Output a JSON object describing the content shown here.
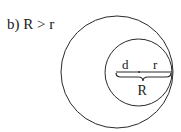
{
  "caption": "b) R > r",
  "labels": {
    "d": "d",
    "r": "r",
    "R": "R"
  },
  "colors": {
    "stroke": "#2a2a2a",
    "text": "#1a1a1a",
    "background": "#ffffff"
  },
  "figure": {
    "outer_circle": {
      "cx": 117,
      "cy": 72,
      "r": 56
    },
    "inner_circle": {
      "cx": 138.5,
      "cy": 72.5,
      "r": 33.5
    },
    "segment": {
      "x1": 116,
      "x2": 172,
      "y": 72,
      "midpoint_x": 139
    }
  }
}
